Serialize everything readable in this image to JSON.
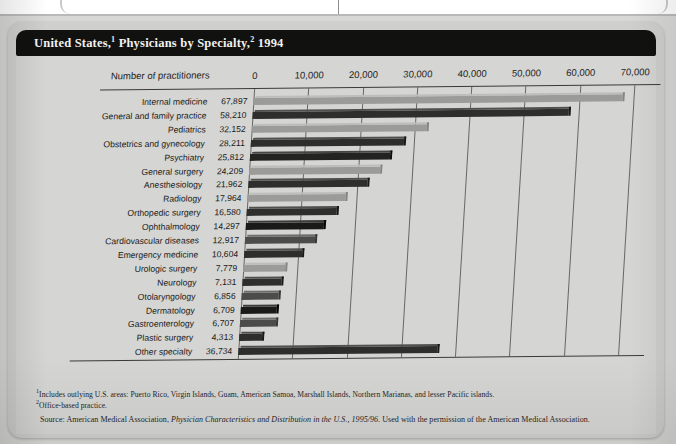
{
  "page": {
    "background_color": "#d8d8d6",
    "card_color": "#cfcfcd"
  },
  "header": {
    "title_prefix": "United States,",
    "title_sup1": "1",
    "title_middle": " Physicians by Specialty,",
    "title_sup2": "2",
    "title_suffix": " 1994",
    "title_plain": "United States,1 Physicians by Specialty,2 1994",
    "title_bar_color": "#111110",
    "title_text_color": "#f2f2f0"
  },
  "axis": {
    "caption": "Number of practitioners",
    "ticks": [
      "0",
      "10,000",
      "20,000",
      "30,000",
      "40,000",
      "50,000",
      "60,000",
      "70,000"
    ]
  },
  "footnotes": {
    "note1_marker": "1",
    "note1": "Includes outlying U.S. areas: Puerto Rico, Virgin Islands, Guam, American Samoa, Marshall Islands, Northern Marianas, and lesser Pacific islands.",
    "note2_marker": "2",
    "note2": "Office-based practice.",
    "source_prefix": "Source: American Medical Association, ",
    "source_italic": "Physician Characteristics and Distribution in the U.S., 1995/96.",
    "source_suffix": " Used with the permission of the American Medical Association."
  },
  "chart_data": {
    "type": "bar",
    "orientation": "horizontal",
    "xlabel": "Number of practitioners",
    "ylabel": "",
    "xlim": [
      0,
      70000
    ],
    "xticks": [
      0,
      10000,
      20000,
      30000,
      40000,
      50000,
      60000,
      70000
    ],
    "grid": true,
    "legend": "none",
    "categories": [
      "Internal medicine",
      "General and family practice",
      "Pediatrics",
      "Obstetrics and gynecology",
      "Psychiatry",
      "General surgery",
      "Anesthesiology",
      "Radiology",
      "Orthopedic surgery",
      "Ophthalmology",
      "Cardiovascular diseases",
      "Emergency medicine",
      "Urologic surgery",
      "Neurology",
      "Otolaryngology",
      "Dermatology",
      "Gastroenterology",
      "Plastic surgery",
      "Other specialty"
    ],
    "values": [
      67897,
      58210,
      32152,
      28211,
      25812,
      24209,
      21962,
      17964,
      16580,
      14297,
      12917,
      10604,
      7779,
      7131,
      6856,
      6709,
      6707,
      4313,
      36734
    ],
    "value_labels": [
      "67,897",
      "58,210",
      "32,152",
      "28,211",
      "25,812",
      "24,209",
      "21,962",
      "17,964",
      "16,580",
      "14,297",
      "12,917",
      "10,604",
      "7,779",
      "7,131",
      "6,856",
      "6,709",
      "6,707",
      "4,313",
      "36,734"
    ],
    "bar_colors": [
      "#9b9b99",
      "#2e2e2c",
      "#9b9b99",
      "#2e2e2c",
      "#232321",
      "#9b9b99",
      "#2e2e2c",
      "#9b9b99",
      "#2e2e2c",
      "#1a1a18",
      "#4c4c4a",
      "#2e2e2c",
      "#9b9b99",
      "#2e2e2c",
      "#4c4c4a",
      "#1a1a18",
      "#4c4c4a",
      "#2e2e2c",
      "#2e2e2c"
    ]
  }
}
